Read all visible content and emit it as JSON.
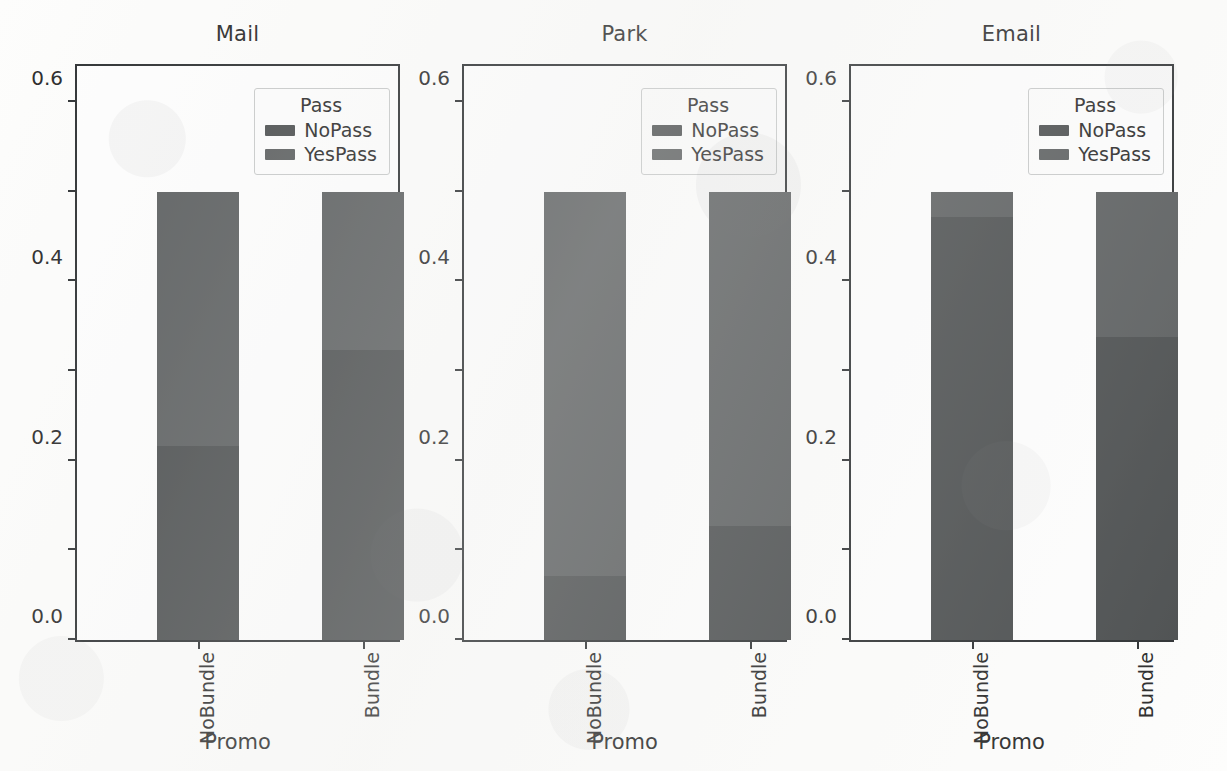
{
  "figure": {
    "background_color": "#fdfdfc",
    "axis_color": "#2f3234",
    "text_color": "#2b2b2b"
  },
  "chart_data": {
    "type": "bar",
    "title": "",
    "subtitle": "",
    "stacked": true,
    "normalized": true,
    "xlabel": "Promo",
    "ylabel": "",
    "ylim": [
      0.0,
      1.2889
    ],
    "grid": false,
    "categories": [
      "NoBundle",
      "Bundle"
    ],
    "legend": {
      "title": "Pass",
      "position": "upper right inside axes",
      "entries": [
        {
          "name": "NoPass",
          "color": "#4d5051"
        },
        {
          "name": "YesPass",
          "color": "#5d6061"
        }
      ]
    },
    "y_ticks": [
      0.0,
      0.2,
      0.4,
      0.6,
      0.8,
      1.0,
      1.2
    ],
    "y_tick_labels": [
      "0.0",
      "0.2",
      "0.4",
      "0.6",
      "0.8",
      "1.0",
      "1.2"
    ],
    "panels": [
      {
        "title": "Mail",
        "series": [
          {
            "name": "NoPass",
            "values": [
              0.433,
              0.647
            ]
          },
          {
            "name": "YesPass",
            "values": [
              0.567,
              0.353
            ]
          }
        ]
      },
      {
        "title": "Park",
        "series": [
          {
            "name": "NoPass",
            "values": [
              0.143,
              0.254
            ]
          },
          {
            "name": "YesPass",
            "values": [
              0.857,
              0.746
            ]
          }
        ]
      },
      {
        "title": "Email",
        "series": [
          {
            "name": "NoPass",
            "values": [
              0.944,
              0.676
            ]
          },
          {
            "name": "YesPass",
            "values": [
              0.056,
              0.324
            ]
          }
        ]
      }
    ]
  }
}
